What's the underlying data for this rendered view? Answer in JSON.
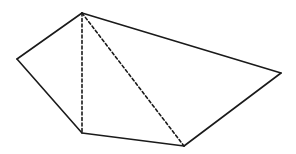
{
  "diagram": {
    "type": "pentagon-triangulation",
    "stroke_color": "#1a1a1a",
    "background": "#ffffff",
    "vertices": {
      "A": [
        82,
        13
      ],
      "B": [
        17,
        59
      ],
      "C": [
        82,
        133
      ],
      "D": [
        184,
        146
      ],
      "E": [
        281,
        73
      ]
    },
    "solid_edges": [
      [
        "A",
        "B"
      ],
      [
        "B",
        "C"
      ],
      [
        "C",
        "D"
      ],
      [
        "D",
        "E"
      ],
      [
        "E",
        "A"
      ]
    ],
    "dashed_edges": [
      [
        "A",
        "C"
      ],
      [
        "A",
        "D"
      ]
    ]
  }
}
